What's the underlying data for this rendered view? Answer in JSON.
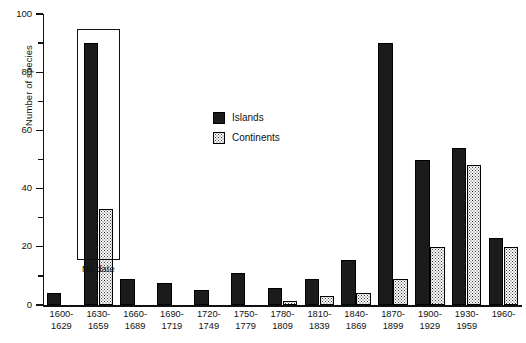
{
  "chart_data": {
    "type": "bar",
    "title": "",
    "xlabel": "",
    "ylabel": "Number of species",
    "ylim": [
      0,
      100
    ],
    "ytick_major": [
      0,
      20,
      40,
      60,
      80,
      100
    ],
    "ytick_minor": [
      10,
      30,
      50,
      70,
      90
    ],
    "grid": false,
    "legend_position": "upper center",
    "categories": [
      "1600-1629",
      "1630-1659",
      "1660-1689",
      "1690-1719",
      "1720-1749",
      "1750-1779",
      "1780-1809",
      "1810-1839",
      "1840-1869",
      "1870-1899",
      "1900-1929",
      "1930-1959",
      "1960-"
    ],
    "category_lines": [
      [
        "1600-",
        "1629"
      ],
      [
        "1630-",
        "1659"
      ],
      [
        "1660-",
        "1689"
      ],
      [
        "1690-",
        "1719"
      ],
      [
        "1720-",
        "1749"
      ],
      [
        "1750-",
        "1779"
      ],
      [
        "1780-",
        "1809"
      ],
      [
        "1810-",
        "1839"
      ],
      [
        "1840-",
        "1869"
      ],
      [
        "1870-",
        "1899"
      ],
      [
        "1900-",
        "1929"
      ],
      [
        "1930-",
        "1959"
      ],
      [
        "1960-",
        ""
      ]
    ],
    "series": [
      {
        "name": "Islands",
        "color": "#1b1b1b",
        "fill": "solid-black",
        "values": [
          4,
          90,
          9,
          7.5,
          5,
          11,
          6,
          9,
          15.5,
          90,
          50,
          54,
          23
        ]
      },
      {
        "name": "Continents",
        "color": "#cccccc",
        "fill": "stippled",
        "values": [
          0,
          33,
          0,
          0,
          0,
          0,
          1.5,
          3,
          4,
          9,
          20,
          48,
          20
        ]
      }
    ],
    "annotations": [
      {
        "name": "no-date-callout",
        "label": "No date",
        "applies_to_category": "1630-1659",
        "description": "Rectangular box drawn around the 1630-1659 pair of bars, labelled 'No date' beneath."
      }
    ]
  },
  "legend": {
    "items": [
      {
        "label": "Islands"
      },
      {
        "label": "Continents"
      }
    ]
  }
}
